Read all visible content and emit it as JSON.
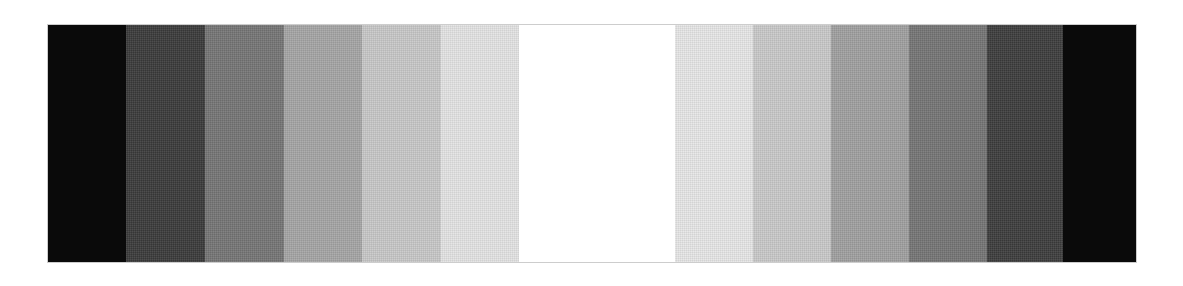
{
  "page": {
    "background_color": "#ffffff",
    "width": 1183,
    "height": 286
  },
  "wedge": {
    "name": "grayscale-step-wedge",
    "x": 48,
    "y": 25,
    "width": 1088,
    "height": 237,
    "border_color": "#cdcdcd",
    "symmetry": "mirrored",
    "step_count": 14,
    "steps": [
      {
        "index": 1,
        "color": "#0a0a0a",
        "width": 78,
        "label": "black",
        "tone_percent": 100,
        "textured": false
      },
      {
        "index": 2,
        "color": "#3a3a3a",
        "width": 79,
        "label": "very dark gray",
        "tone_percent": 85,
        "textured": true
      },
      {
        "index": 3,
        "color": "#757575",
        "width": 79,
        "label": "dark gray",
        "tone_percent": 65,
        "textured": true
      },
      {
        "index": 4,
        "color": "#a5a5a5",
        "width": 78,
        "label": "mid gray",
        "tone_percent": 45,
        "textured": true
      },
      {
        "index": 5,
        "color": "#c8c8c8",
        "width": 79,
        "label": "light gray",
        "tone_percent": 30,
        "textured": true
      },
      {
        "index": 6,
        "color": "#e4e4e4",
        "width": 78,
        "label": "very light gray",
        "tone_percent": 15,
        "textured": true
      },
      {
        "index": 7,
        "color": "#ffffff",
        "width": 78,
        "label": "white",
        "tone_percent": 0,
        "textured": false
      },
      {
        "index": 8,
        "color": "#ffffff",
        "width": 78,
        "label": "white",
        "tone_percent": 0,
        "textured": false
      },
      {
        "index": 9,
        "color": "#e7e7e7",
        "width": 78,
        "label": "very light gray",
        "tone_percent": 15,
        "textured": true
      },
      {
        "index": 10,
        "color": "#c9c9c9",
        "width": 78,
        "label": "light gray",
        "tone_percent": 30,
        "textured": true
      },
      {
        "index": 11,
        "color": "#a0a0a0",
        "width": 78,
        "label": "mid gray",
        "tone_percent": 45,
        "textured": true
      },
      {
        "index": 12,
        "color": "#757575",
        "width": 78,
        "label": "dark gray",
        "tone_percent": 65,
        "textured": true
      },
      {
        "index": 13,
        "color": "#3d3d3d",
        "width": 76,
        "label": "very dark gray",
        "tone_percent": 85,
        "textured": true
      },
      {
        "index": 14,
        "color": "#0a0a0a",
        "width": 73,
        "label": "black",
        "tone_percent": 100,
        "textured": false
      }
    ]
  },
  "chart_data": {
    "type": "bar",
    "xlabel": "",
    "ylabel": "",
    "categories": [
      "1",
      "2",
      "3",
      "4",
      "5",
      "6",
      "7",
      "8",
      "9",
      "10",
      "11",
      "12",
      "13",
      "14"
    ],
    "values": [
      10,
      58,
      117,
      165,
      200,
      228,
      255,
      255,
      231,
      201,
      160,
      117,
      61,
      10
    ],
    "ylim": [
      0,
      255
    ],
    "grid": false,
    "legend": "none"
  }
}
